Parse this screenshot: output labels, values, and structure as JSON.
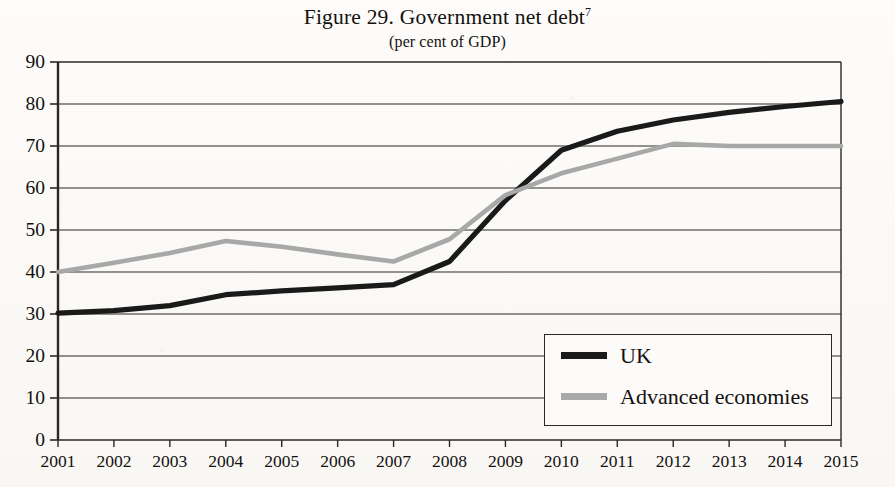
{
  "figure": {
    "title_main": "Figure 29. Government net debt",
    "title_footnote": "7",
    "subtitle": "(per cent of GDP)"
  },
  "legend": {
    "items": [
      {
        "label": "UK",
        "color": "#1a1a1a"
      },
      {
        "label": "Advanced economies",
        "color": "#a8a8a8"
      }
    ]
  },
  "chart_data": {
    "type": "line",
    "title": "Figure 29. Government net debt",
    "subtitle": "(per cent of GDP)",
    "xlabel": "",
    "ylabel": "",
    "x": [
      "2001",
      "2002",
      "2003",
      "2004",
      "2005",
      "2006",
      "2007",
      "2008",
      "2009",
      "2010",
      "2011",
      "2012",
      "2013",
      "2014",
      "2015"
    ],
    "xlim": [
      2001,
      2015
    ],
    "ylim": [
      0,
      90
    ],
    "yticks": [
      0,
      10,
      20,
      30,
      40,
      50,
      60,
      70,
      80,
      90
    ],
    "grid": "horizontal",
    "legend_position": "bottom-right",
    "series": [
      {
        "name": "UK",
        "color": "#1a1a1a",
        "values": [
          30.2,
          30.8,
          32.0,
          34.6,
          35.5,
          36.2,
          37.0,
          42.5,
          57.0,
          69.0,
          73.5,
          76.2,
          78.0,
          79.4,
          80.6
        ]
      },
      {
        "name": "Advanced economies",
        "color": "#a8a8a8",
        "values": [
          40.0,
          42.2,
          44.5,
          47.4,
          46.0,
          44.2,
          42.5,
          47.8,
          58.3,
          63.5,
          67.0,
          70.5,
          70.0,
          70.0,
          70.0
        ]
      }
    ]
  },
  "axes": {
    "y_tick_labels": [
      "90",
      "80",
      "70",
      "60",
      "50",
      "40",
      "30",
      "20",
      "10",
      "0"
    ],
    "x_tick_labels": [
      "2001",
      "2002",
      "2003",
      "2004",
      "2005",
      "2006",
      "2007",
      "2008",
      "2009",
      "2010",
      "2011",
      "2012",
      "2013",
      "2014",
      "2015"
    ]
  }
}
